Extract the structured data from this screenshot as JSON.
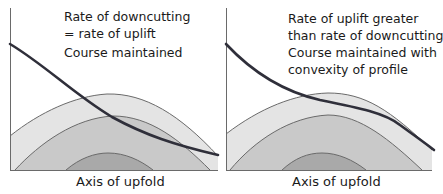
{
  "panels": [
    {
      "id": "left",
      "title_lines": [
        "Rate of downcutting",
        "= rate of uplift"
      ],
      "caption_lines": [
        "Course maintained"
      ],
      "axis_label": "Axis of upfold"
    },
    {
      "id": "right",
      "title_lines": [
        "Rate of uplift greater",
        "than rate of downcutting"
      ],
      "caption_lines": [
        "Course maintained with",
        "convexity of profile"
      ],
      "axis_label": "Axis of upfold"
    }
  ],
  "colors": {
    "outer_fold": "#e4e4e4",
    "middle_fold": "#c9c9c9",
    "inner_fold": "#a9a9a9",
    "fold_outline": "#6a6a6a",
    "river": "#2f2f3a",
    "axis": "#6a6a6a"
  }
}
